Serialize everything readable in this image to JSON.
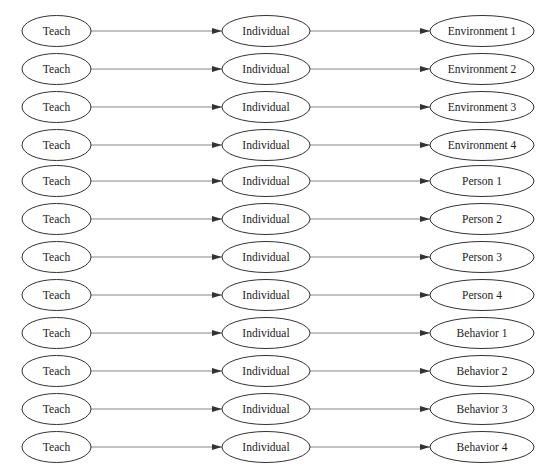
{
  "diagram": {
    "type": "flow",
    "columns": [
      {
        "name": "source",
        "cx": 56.5,
        "rx": 34.5
      },
      {
        "name": "middle",
        "cx": 266,
        "rx": 44
      },
      {
        "name": "target",
        "cx": 482,
        "rx": 52
      }
    ],
    "ry": 15.5,
    "row_centers": [
      31,
      69,
      107,
      145,
      181,
      219,
      257,
      295,
      333,
      371,
      409,
      447
    ],
    "stroke_color": "#333333",
    "edge_color": "#666666",
    "rows": [
      {
        "source": "Teach",
        "middle": "Individual",
        "target": "Environment 1"
      },
      {
        "source": "Teach",
        "middle": "Individual",
        "target": "Environment 2"
      },
      {
        "source": "Teach",
        "middle": "Individual",
        "target": "Environment 3"
      },
      {
        "source": "Teach",
        "middle": "Individual",
        "target": "Environment 4"
      },
      {
        "source": "Teach",
        "middle": "Individual",
        "target": "Person 1"
      },
      {
        "source": "Teach",
        "middle": "Individual",
        "target": "Person 2"
      },
      {
        "source": "Teach",
        "middle": "Individual",
        "target": "Person 3"
      },
      {
        "source": "Teach",
        "middle": "Individual",
        "target": "Person 4"
      },
      {
        "source": "Teach",
        "middle": "Individual",
        "target": "Behavior 1"
      },
      {
        "source": "Teach",
        "middle": "Individual",
        "target": "Behavior 2"
      },
      {
        "source": "Teach",
        "middle": "Individual",
        "target": "Behavior 3"
      },
      {
        "source": "Teach",
        "middle": "Individual",
        "target": "Behavior 4"
      }
    ]
  }
}
